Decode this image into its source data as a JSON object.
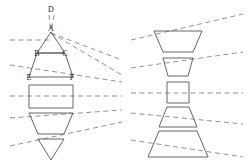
{
  "figure": {
    "title": "",
    "width": 251,
    "height": 163,
    "background_color": "#ffffff",
    "stroke_color": "#555555",
    "dash_color": "#777777",
    "label_color": "#222222",
    "vertex_labels": [
      {
        "id": "D",
        "text": "D",
        "x": 51,
        "y": 12
      },
      {
        "id": "A",
        "text": "A",
        "x": 51,
        "y": 31
      },
      {
        "id": "B",
        "text": "B",
        "x": 37,
        "y": 56
      },
      {
        "id": "C",
        "text": "C",
        "x": 65,
        "y": 56
      },
      {
        "id": "E",
        "text": "E",
        "x": 29,
        "y": 80
      },
      {
        "id": "F",
        "text": "F",
        "x": 72,
        "y": 80
      }
    ],
    "left_column": {
      "name": "left-shape-stack",
      "center_x": 51,
      "shapes": [
        {
          "id": "L1",
          "type": "triangle-up",
          "apex_x": 51,
          "apex_y": 32,
          "base_y": 53,
          "base_half_width": 14
        },
        {
          "id": "L2",
          "type": "trapezoid-up",
          "top_y": 53,
          "bottom_y": 77,
          "top_half_width": 14,
          "bottom_half_width": 22
        },
        {
          "id": "L3",
          "type": "rectangle",
          "top_y": 85,
          "bottom_y": 108,
          "half_width": 22
        },
        {
          "id": "L4",
          "type": "trapezoid-down",
          "top_y": 113,
          "bottom_y": 134,
          "top_half_width": 22,
          "bottom_half_width": 13
        },
        {
          "id": "L5",
          "type": "triangle-down",
          "top_y": 139,
          "apex_y": 160,
          "top_half_width": 13,
          "apex_x": 51
        }
      ]
    },
    "right_column": {
      "name": "right-shape-stack",
      "center_x": 178,
      "shapes": [
        {
          "id": "R1",
          "type": "trapezoid-down",
          "top_y": 31,
          "bottom_y": 52,
          "top_half_width": 24,
          "bottom_half_width": 15
        },
        {
          "id": "R2",
          "type": "trapezoid-down",
          "top_y": 58,
          "bottom_y": 76,
          "top_half_width": 15,
          "bottom_half_width": 10
        },
        {
          "id": "R3",
          "type": "square",
          "top_y": 82,
          "bottom_y": 103,
          "half_width": 11
        },
        {
          "id": "R4",
          "type": "trapezoid-up",
          "top_y": 107,
          "bottom_y": 127,
          "top_half_width": 11,
          "bottom_half_width": 19
        },
        {
          "id": "R5",
          "type": "trapezoid-up",
          "top_y": 131,
          "bottom_y": 157,
          "top_half_width": 19,
          "bottom_half_width": 30
        }
      ]
    },
    "left_dashed_rays": [
      {
        "id": "LD0",
        "x1": 49,
        "y1": 15,
        "x2": 51,
        "y2": 33
      },
      {
        "id": "LD1",
        "x1": 54,
        "y1": 15,
        "x2": 51,
        "y2": 33
      },
      {
        "id": "LD2",
        "x1": 10,
        "y1": 40,
        "x2": 51,
        "y2": 40
      },
      {
        "id": "LD3",
        "x1": 51,
        "y1": 33,
        "x2": 122,
        "y2": 60
      },
      {
        "id": "LD4",
        "x1": 51,
        "y1": 33,
        "x2": 122,
        "y2": 75
      },
      {
        "id": "LD5",
        "x1": 10,
        "y1": 65,
        "x2": 122,
        "y2": 82
      },
      {
        "id": "LD6",
        "x1": 10,
        "y1": 96,
        "x2": 122,
        "y2": 96
      },
      {
        "id": "LD7",
        "x1": 10,
        "y1": 118,
        "x2": 122,
        "y2": 110
      },
      {
        "id": "LD8",
        "x1": 10,
        "y1": 146,
        "x2": 122,
        "y2": 122
      }
    ],
    "right_dashed_rays": [
      {
        "id": "RD1",
        "x1": 131,
        "y1": 40,
        "x2": 243,
        "y2": 14
      },
      {
        "id": "RD2",
        "x1": 131,
        "y1": 68,
        "x2": 243,
        "y2": 52
      },
      {
        "id": "RD3",
        "x1": 131,
        "y1": 93,
        "x2": 243,
        "y2": 93
      },
      {
        "id": "RD4",
        "x1": 131,
        "y1": 113,
        "x2": 243,
        "y2": 124
      },
      {
        "id": "RD5",
        "x1": 131,
        "y1": 140,
        "x2": 243,
        "y2": 157
      }
    ]
  }
}
